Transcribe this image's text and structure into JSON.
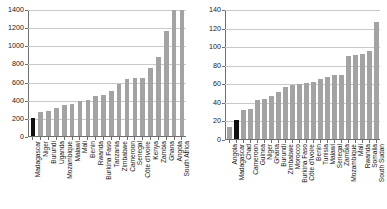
{
  "figure": {
    "background": "#ffffff",
    "bar_color": "#a3a3a3",
    "highlight_color": "#111111",
    "grid_color": "#c9c9c9",
    "axis_color": "#6e6e6e"
  },
  "chart_data": [
    {
      "type": "bar",
      "panel": "left",
      "title": "",
      "xlabel": "",
      "ylabel": "",
      "ylim": [
        0,
        1400
      ],
      "yticks": [
        0,
        200,
        400,
        600,
        800,
        1000,
        1200,
        1400
      ],
      "grid": true,
      "legend": "none",
      "highlight_category": "Madagascar",
      "categories": [
        "Madagascar",
        "Niger",
        "Burundi",
        "Uganda",
        "Mozambique",
        "Malawi",
        "Mali",
        "Benin",
        "Rwanda",
        "Burkina Faso",
        "Tanzania",
        "Zimbabwe",
        "Cameroon",
        "Senegal",
        "Côte d'Ivoire",
        "Kenya",
        "Zambia",
        "Ghana",
        "Angola",
        "South Africa"
      ],
      "values": [
        205,
        265,
        275,
        315,
        340,
        355,
        385,
        400,
        450,
        460,
        500,
        575,
        630,
        640,
        645,
        755,
        880,
        1170,
        1400,
        1400
      ]
    },
    {
      "type": "bar",
      "panel": "right",
      "title": "",
      "xlabel": "",
      "ylabel": "",
      "ylim": [
        0,
        140
      ],
      "yticks": [
        0,
        20,
        40,
        60,
        80,
        100,
        120,
        140
      ],
      "grid": true,
      "legend": "none",
      "highlight_category": "Madagascar",
      "categories": [
        "Angola",
        "Madagascar",
        "Chad",
        "Cameroon",
        "Guinea",
        "Niger",
        "Ghana",
        "Burundi",
        "Zimbabwe",
        "Morocco",
        "Burkina Faso",
        "Côte d'Ivoire",
        "Benin",
        "Tunisia",
        "Malawi",
        "Senegal",
        "Zambia",
        "Mozambique",
        "Mali",
        "Rwanda",
        "Somalia",
        "South Sudan"
      ],
      "values": [
        13,
        21,
        31,
        33,
        42,
        43,
        47,
        51,
        56,
        59,
        60,
        61,
        62,
        65,
        67,
        69,
        70,
        90,
        91,
        92,
        95,
        127
      ]
    }
  ]
}
